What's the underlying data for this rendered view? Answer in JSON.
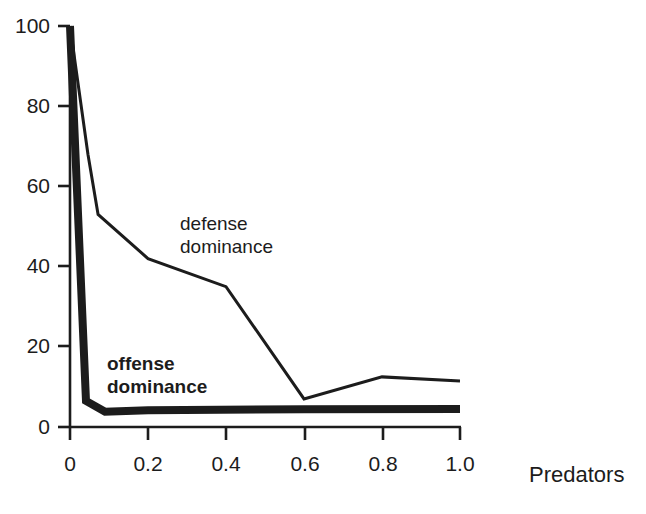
{
  "chart_data": {
    "type": "line",
    "title": "",
    "subtitle": "",
    "xlabel": "Predators",
    "ylabel": "",
    "xlim": [
      0,
      1.0
    ],
    "ylim": [
      0,
      100
    ],
    "grid": false,
    "legend_position": "inline-annotations",
    "x_ticks": [
      "0",
      "0.2",
      "0.4",
      "0.6",
      "0.8",
      "1.0"
    ],
    "x_tick_values": [
      0,
      0.2,
      0.4,
      0.6,
      0.8,
      1.0
    ],
    "y_ticks": [
      "0",
      "20",
      "40",
      "60",
      "80",
      "100"
    ],
    "y_tick_values": [
      0,
      20,
      40,
      60,
      80,
      100
    ],
    "series": [
      {
        "name": "defense dominance",
        "style": "thin",
        "color": "#1c1c1c",
        "line_width": 3,
        "label_lines": [
          "defense",
          "dominance"
        ],
        "label_bold": false,
        "points": [
          {
            "x": 0.0,
            "y": 100
          },
          {
            "x": 0.046,
            "y": 68
          },
          {
            "x": 0.072,
            "y": 53
          },
          {
            "x": 0.2,
            "y": 42
          },
          {
            "x": 0.4,
            "y": 35
          },
          {
            "x": 0.6,
            "y": 7
          },
          {
            "x": 0.8,
            "y": 12.5
          },
          {
            "x": 1.0,
            "y": 11.5
          }
        ]
      },
      {
        "name": "offense dominance",
        "style": "thick",
        "color": "#1c1c1c",
        "line_width": 8,
        "label_lines": [
          "offense",
          "dominance"
        ],
        "label_bold": true,
        "points": [
          {
            "x": 0.0,
            "y": 100
          },
          {
            "x": 0.041,
            "y": 6.5
          },
          {
            "x": 0.09,
            "y": 3.8
          },
          {
            "x": 0.2,
            "y": 4.2
          },
          {
            "x": 0.6,
            "y": 4.4
          },
          {
            "x": 1.0,
            "y": 4.5
          }
        ]
      }
    ]
  },
  "axis": {
    "x_title": "Predators",
    "y_tick_0": "0",
    "y_tick_20": "20",
    "y_tick_40": "40",
    "y_tick_60": "60",
    "y_tick_80": "80",
    "y_tick_100": "100",
    "x_tick_0": "0",
    "x_tick_02": "0.2",
    "x_tick_04": "0.4",
    "x_tick_06": "0.6",
    "x_tick_08": "0.8",
    "x_tick_10": "1.0"
  },
  "annotations": {
    "defense_line1": "defense",
    "defense_line2": "dominance",
    "offense_line1": "offense",
    "offense_line2": "dominance"
  },
  "colors": {
    "ink": "#1c1c1c",
    "background": "#ffffff"
  }
}
